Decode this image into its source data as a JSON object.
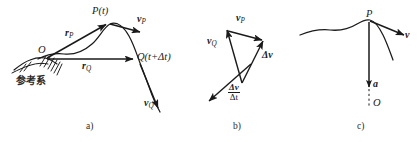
{
  "figure": {
    "width": 419,
    "height": 142,
    "background": "#ffffff",
    "ink_color": "#1a1a1a"
  },
  "panels": [
    {
      "id": "a",
      "caption": "a)",
      "description": "Trajectory with position vectors from origin O of a reference frame to points P(t) and Q(t+Δt), with velocity vectors tangent to the path.",
      "labels": {
        "point_p": "P(t)",
        "point_q": "Q(t+Δt)",
        "origin": "O",
        "vector_rp": "r",
        "vector_rp_sub": "P",
        "vector_rq": "r",
        "vector_rq_sub": "Q",
        "vector_vp": "v",
        "vector_vp_sub": "P",
        "vector_vq": "v",
        "vector_vq_sub": "Q",
        "reference_frame": "参考系"
      }
    },
    {
      "id": "b",
      "caption": "b)",
      "description": "Velocity triangle showing v_P, v_Q and their difference Δv, plus the average acceleration Δv/Δt.",
      "labels": {
        "vector_vp": "v",
        "vector_vp_sub": "P",
        "vector_vq": "v",
        "vector_vq_sub": "Q",
        "delta_v": "Δv",
        "ratio_numerator": "Δv",
        "ratio_denominator": "Δt"
      }
    },
    {
      "id": "c",
      "caption": "c)",
      "description": "Instantaneous velocity v tangent to the path at P and acceleration a directed toward the centre of curvature O.",
      "labels": {
        "point_p": "P",
        "vector_v": "v",
        "vector_a": "a",
        "centre": "O"
      }
    }
  ]
}
